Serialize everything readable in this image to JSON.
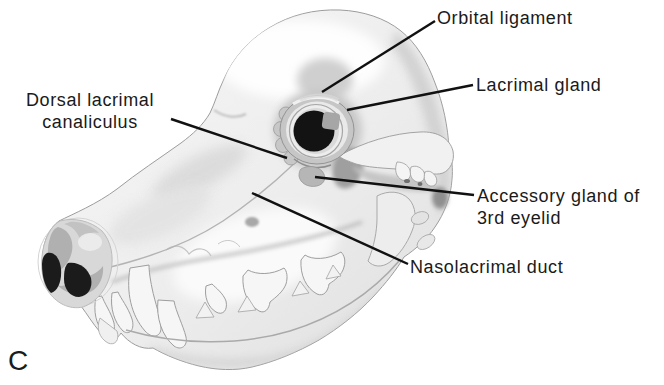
{
  "figure": {
    "type": "anatomical-diagram",
    "panel_letter": "C",
    "labels": {
      "orbital_ligament": "Orbital ligament",
      "lacrimal_gland": "Lacrimal gland",
      "dorsal_lacrimal_canaliculus_line1": "Dorsal lacrimal",
      "dorsal_lacrimal_canaliculus_line2": "canaliculus",
      "accessory_gland_line1": "Accessory gland of",
      "accessory_gland_line2": "3rd eyelid",
      "nasolacrimal_duct": "Nasolacrimal duct"
    },
    "colors": {
      "background": "#ffffff",
      "text": "#1a1a1a",
      "leader_line": "#111111",
      "bone_light": "#f6f6f6",
      "bone_mid": "#d9d9d9",
      "bone_shadow": "#ababab",
      "pupil": "#131313",
      "nostril": "#1b1b1b"
    }
  }
}
